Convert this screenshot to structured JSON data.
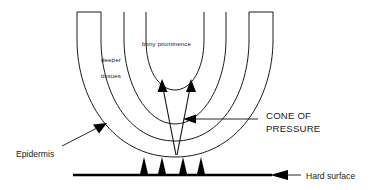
{
  "figure": {
    "title_present": false,
    "background_color": "#ffffff",
    "stroke_color": "#1a1a1a",
    "fill_color": "#000000"
  },
  "labels": {
    "deeper": "deeper",
    "tissues": "tissues",
    "bony_prominence": "bony prominence",
    "cone_of_pressure_line1": "CONE OF",
    "cone_of_pressure_line2": "PRESSURE",
    "epidermis": "Epidermis",
    "hard_surface": "Hard surface"
  },
  "annotations": {
    "pressure_arrow_count": 4,
    "cone_arrow_count": 2,
    "tissue_layer_count": 3
  }
}
